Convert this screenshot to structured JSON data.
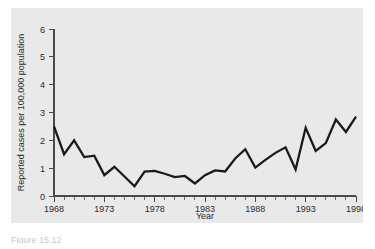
{
  "chart_data": {
    "type": "line",
    "title": "",
    "xlabel": "Year",
    "ylabel": "Reported cases per 100,000 population",
    "xlim": [
      1968,
      1998
    ],
    "ylim": [
      0,
      6
    ],
    "grid": false,
    "legend": null,
    "y_ticks": [
      0,
      1,
      2,
      3,
      4,
      5,
      6
    ],
    "y_tick_labels": [
      "0",
      "1",
      "2",
      "3",
      "4",
      "5",
      "6"
    ],
    "x_ticks": [
      1968,
      1973,
      1978,
      1983,
      1988,
      1993,
      1998
    ],
    "x_tick_labels": [
      "1968",
      "1973",
      "1978",
      "1983",
      "1988",
      "1993",
      "1998"
    ],
    "x_minor_tick_interval": 1,
    "series_color": "#1a1a1a",
    "x": [
      1968,
      1969,
      1970,
      1971,
      1972,
      1973,
      1974,
      1975,
      1976,
      1977,
      1978,
      1979,
      1980,
      1981,
      1982,
      1983,
      1984,
      1985,
      1986,
      1987,
      1988,
      1989,
      1990,
      1991,
      1992,
      1993,
      1994,
      1995,
      1996,
      1997,
      1998
    ],
    "values": [
      2.5,
      1.5,
      2.0,
      1.4,
      1.45,
      0.75,
      1.05,
      0.7,
      0.35,
      0.88,
      0.9,
      0.8,
      0.68,
      0.72,
      0.45,
      0.75,
      0.92,
      0.88,
      1.35,
      1.68,
      1.02,
      1.3,
      1.55,
      1.75,
      0.95,
      2.45,
      1.62,
      1.9,
      2.75,
      2.3,
      2.85
    ]
  },
  "caption": {
    "fragment": "Figure  15.12"
  }
}
